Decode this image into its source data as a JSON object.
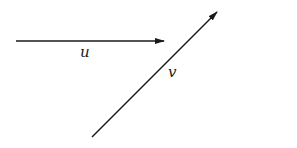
{
  "diagram": {
    "stroke_color": "#1a1a1a",
    "vectors": [
      {
        "name": "u",
        "label": "u",
        "from": [
          16,
          41
        ],
        "to": [
          164,
          41
        ]
      },
      {
        "name": "v",
        "label": "v",
        "from": [
          92,
          137
        ],
        "to": [
          217,
          12
        ]
      }
    ]
  }
}
